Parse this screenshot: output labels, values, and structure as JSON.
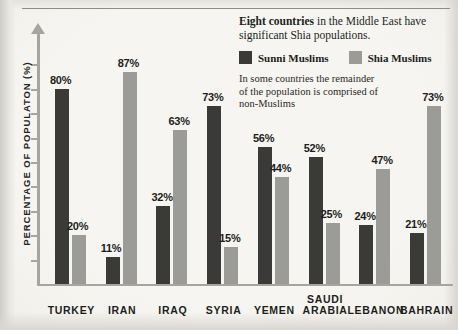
{
  "annotation": {
    "headline_bold": "Eight countries",
    "headline_rest": " in the Middle East have significant Shia populations.",
    "note": "In some countries the remainder of the population is comprised of non-Muslims"
  },
  "legend": {
    "sunni_label": "Sunni Muslims",
    "shia_label": "Shia Muslims",
    "sunni_color": "#3a3a38",
    "shia_color": "#9b9b98"
  },
  "axis": {
    "ylabel": "PERCENTAGE OF POPULATON (%)"
  },
  "chart_data": {
    "type": "bar",
    "title": "Eight countries in the Middle East have significant Shia populations.",
    "xlabel": "",
    "ylabel": "PERCENTAGE OF POPULATON (%)",
    "ylim": [
      0,
      100
    ],
    "grid": false,
    "legend_position": "top-right",
    "categories": [
      "TURKEY",
      "IRAN",
      "IRAQ",
      "SYRIA",
      "YEMEN",
      "SAUDI\nARABIA",
      "LEBANON",
      "BAHRAIN"
    ],
    "series": [
      {
        "name": "Sunni Muslims",
        "color": "#3a3a38",
        "values": [
          80,
          11,
          32,
          73,
          56,
          52,
          24,
          21
        ],
        "labels": [
          "80%",
          "11%",
          "32%",
          "73%",
          "56%",
          "52%",
          "24%",
          "21%"
        ]
      },
      {
        "name": "Shia Muslims",
        "color": "#9b9b98",
        "values": [
          20,
          87,
          63,
          15,
          44,
          25,
          47,
          73
        ],
        "labels": [
          "20%",
          "87%",
          "63%",
          "15%",
          "44%",
          "25%",
          "47%",
          "73%"
        ]
      }
    ],
    "yticks": [
      10,
      20,
      30,
      40,
      50,
      60,
      70,
      80,
      90
    ]
  }
}
